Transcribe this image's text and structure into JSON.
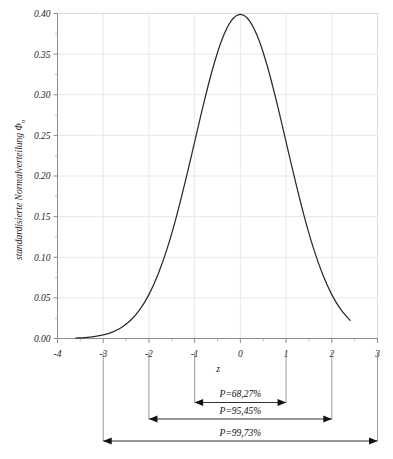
{
  "chart_data": {
    "type": "line",
    "title": "",
    "xlabel": "z",
    "ylabel": "standardisierte Normalverteilung Φ",
    "ylabel_subscript": "n",
    "xlim": [
      -4,
      3
    ],
    "ylim": [
      0.0,
      0.4
    ],
    "grid": true,
    "legend": "none",
    "x_ticks": [
      "-4",
      "-3",
      "-2",
      "-1",
      "0",
      "1",
      "2",
      "3"
    ],
    "x_tick_values": [
      -4,
      -3,
      -2,
      -1,
      0,
      1,
      2,
      3
    ],
    "y_ticks": [
      "0.00",
      "0.05",
      "0.10",
      "0.15",
      "0.20",
      "0.25",
      "0.30",
      "0.35",
      "0.40"
    ],
    "y_tick_values": [
      0.0,
      0.05,
      0.1,
      0.15,
      0.2,
      0.25,
      0.3,
      0.35,
      0.4
    ],
    "series": [
      {
        "name": "standardisierte Normalverteilung",
        "x": [
          -3.6,
          -3.4,
          -3.2,
          -3.0,
          -2.8,
          -2.6,
          -2.4,
          -2.2,
          -2.0,
          -1.8,
          -1.6,
          -1.4,
          -1.2,
          -1.0,
          -0.8,
          -0.6,
          -0.4,
          -0.2,
          0.0,
          0.2,
          0.4,
          0.6,
          0.8,
          1.0,
          1.2,
          1.4,
          1.6,
          1.8,
          2.0,
          2.2,
          2.4
        ],
        "values": [
          0.0006,
          0.0012,
          0.0024,
          0.0044,
          0.0079,
          0.0136,
          0.0224,
          0.0355,
          0.054,
          0.079,
          0.1109,
          0.1497,
          0.1942,
          0.242,
          0.2897,
          0.3332,
          0.3683,
          0.391,
          0.3989,
          0.391,
          0.3683,
          0.3332,
          0.2897,
          0.242,
          0.1942,
          0.1497,
          0.1109,
          0.079,
          0.054,
          0.0355,
          0.0224
        ]
      }
    ],
    "annotations": [
      {
        "label": "P=68,27%",
        "from": -1,
        "to": 1,
        "sigma": 1
      },
      {
        "label": "P=95,45%",
        "from": -2,
        "to": 2,
        "sigma": 2
      },
      {
        "label": "P=99,73%",
        "from": -3,
        "to": 3,
        "sigma": 3
      }
    ],
    "colors": {
      "curve": "#2b2b2b",
      "grid": "#e2e2e2",
      "axis": "#8c8c8c",
      "annotation": "#111111",
      "background": "#ffffff"
    }
  }
}
